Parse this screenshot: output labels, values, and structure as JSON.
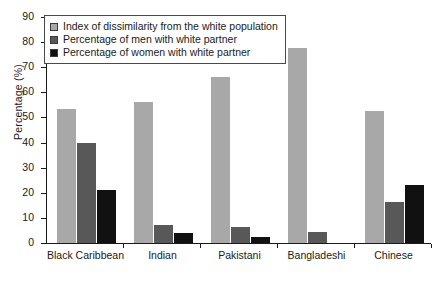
{
  "chart_data": {
    "type": "bar",
    "title": "",
    "subtitle": "",
    "xlabel": "",
    "ylabel": "Percentage (%)",
    "ylim": [
      0,
      90
    ],
    "yticks": [
      0,
      10,
      20,
      30,
      40,
      50,
      60,
      70,
      80,
      90
    ],
    "ytick_labels": [
      "0",
      "10",
      "20",
      "30",
      "40",
      "50",
      "60",
      "70",
      "80",
      "90"
    ],
    "grid": false,
    "legend_position": "top-left",
    "categories": [
      "Black Caribbean",
      "Indian",
      "Pakistani",
      "Bangladeshi",
      "Chinese"
    ],
    "series": [
      {
        "name": "Index of dissimilarity from the white population",
        "color": "#a8a8a8",
        "values": [
          53.5,
          56.0,
          66.0,
          77.5,
          52.5
        ]
      },
      {
        "name": "Percentage of men with white partner",
        "color": "#585858",
        "values": [
          40.0,
          7.0,
          6.2,
          4.5,
          16.5
        ]
      },
      {
        "name": "Percentage of women with white partner",
        "color": "#111111",
        "values": [
          21.0,
          4.0,
          2.3,
          0.0,
          23.0
        ]
      }
    ]
  },
  "legend": {
    "items": [
      {
        "label": "Index of dissimilarity from the white population",
        "color": "#a8a8a8"
      },
      {
        "label": "Percentage of men with white partner",
        "color": "#585858"
      },
      {
        "label": "Percentage of women with white partner",
        "color": "#111111"
      }
    ]
  },
  "colors": {
    "series_light_grey": "#a8a8a8",
    "series_dark_grey": "#585858",
    "series_black": "#111111",
    "axis": "#1a1a1a",
    "background": "#ffffff"
  }
}
